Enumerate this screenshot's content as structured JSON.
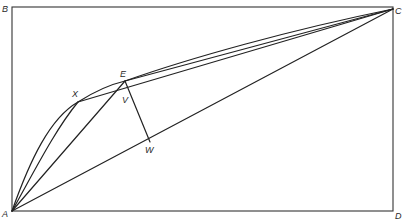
{
  "diagram": {
    "title": "",
    "points": {
      "A": {
        "label": "A",
        "x": 12,
        "y": 211
      },
      "B": {
        "label": "B",
        "x": 12,
        "y": 7
      },
      "C": {
        "label": "C",
        "x": 393,
        "y": 9
      },
      "D": {
        "label": "D",
        "x": 393,
        "y": 211
      },
      "E": {
        "label": "E",
        "x": 125,
        "y": 81
      },
      "X": {
        "label": "X",
        "x": 78,
        "y": 102
      },
      "V": {
        "label": "V",
        "x": 132,
        "y": 91
      },
      "W": {
        "label": "W",
        "x": 150,
        "y": 142
      }
    },
    "labels": {
      "A": "A",
      "B": "B",
      "C": "C",
      "D": "D",
      "E": "E",
      "X": "X",
      "V": "V",
      "W": "W"
    },
    "edges": [
      "A-B",
      "B-C",
      "C-D",
      "D-A",
      "arc A-X-E-C",
      "curve A-X",
      "A-E",
      "A-C",
      "X-C",
      "E-C",
      "E-W"
    ],
    "colors": {
      "stroke": "#222222",
      "background": "#ffffff"
    }
  }
}
